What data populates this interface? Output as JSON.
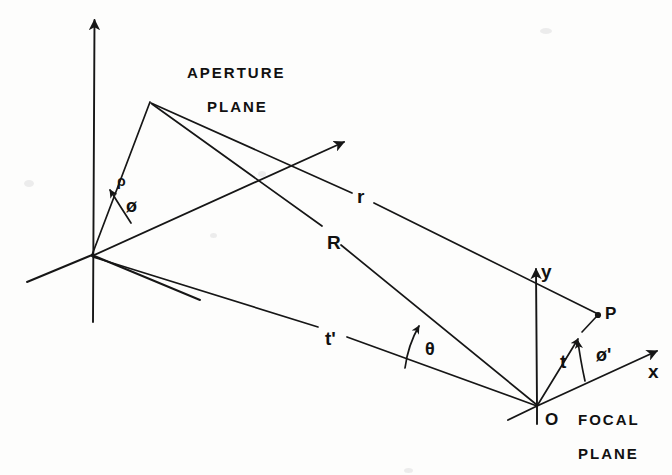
{
  "figure": {
    "background_color": "#fdfdfc",
    "ink_color": "#161616"
  },
  "labels": {
    "aperture_plane_line1": "APERTURE",
    "aperture_plane_line2": "PLANE",
    "focal_plane_line1": "FOCAL",
    "focal_plane_line2": "PLANE",
    "rho": "ρ",
    "phi": "ø",
    "phi_prime": "ø'",
    "theta": "θ",
    "r": "r",
    "R": "R",
    "t": "t",
    "t_prime": "t'",
    "x_axis": "x",
    "y_axis": "y",
    "origin_O": "O",
    "point_P": "P"
  },
  "geometry": {
    "aperture_origin": [
      92,
      255
    ],
    "aperture_point_Q": [
      150,
      102
    ],
    "focal_origin_O": [
      537,
      406
    ],
    "focal_point_P": [
      598,
      315
    ],
    "aperture_vertical_axis": [
      [
        95,
        14
      ],
      [
        93,
        322
      ]
    ],
    "aperture_left_axis_end": [
      27,
      282
    ],
    "aperture_diagonal_arrow_end": [
      348,
      139
    ],
    "focal_x_axis_arrow_end": [
      662,
      349
    ],
    "focal_y_axis_arrow_end": [
      573,
      263
    ],
    "segment_r": "Q to P",
    "segment_R": "Q to O",
    "segment_t_prime": "aperture origin to O",
    "segment_t": "O to P",
    "angle_theta_between": "R and t'",
    "angle_phi_between": "rho and aperture diagonal axis",
    "angle_phi_prime_between": "t and x axis"
  },
  "label_positions": {
    "aperture_plane_line1": [
      187,
      65
    ],
    "aperture_plane_line2": [
      207,
      99
    ],
    "focal_plane_line1": [
      578,
      412
    ],
    "focal_plane_line2": [
      578,
      446
    ],
    "rho": [
      117,
      175
    ],
    "phi": [
      128,
      199
    ],
    "r": [
      357,
      187
    ],
    "R": [
      327,
      233
    ],
    "t_prime": [
      325,
      330
    ],
    "theta": [
      424,
      340
    ],
    "t": [
      560,
      354
    ],
    "phi_prime": [
      598,
      348
    ],
    "x_axis": [
      648,
      364
    ],
    "y_axis": [
      580,
      265
    ],
    "origin_O": [
      545,
      412
    ],
    "point_P": [
      604,
      308
    ]
  }
}
